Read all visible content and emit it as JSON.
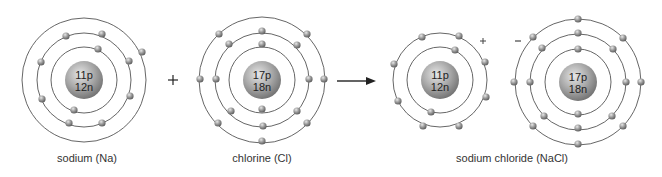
{
  "colors": {
    "orbit": "#555555",
    "electron": "#8a8a8a",
    "nucleus": "#9a9a9a",
    "text": "#222222"
  },
  "atoms": [
    {
      "id": "sodium",
      "label": "sodium (Na)",
      "protons": "11p",
      "neutrons": "12n",
      "center": [
        84,
        80
      ],
      "nucleus_r": 19,
      "shells": [
        33,
        47,
        62
      ],
      "electrons": [
        [
          98,
          49
        ],
        [
          74,
          110
        ],
        [
          66,
          36
        ],
        [
          102,
          34
        ],
        [
          41,
          62
        ],
        [
          129,
          61
        ],
        [
          42,
          99
        ],
        [
          130,
          96
        ],
        [
          69,
          123
        ],
        [
          102,
          123
        ],
        [
          142,
          52
        ]
      ]
    },
    {
      "id": "chlorine",
      "label": "chlorine (Cl)",
      "protons": "17p",
      "neutrons": "18n",
      "center": [
        262,
        80
      ],
      "nucleus_r": 19,
      "shells": [
        33,
        47,
        63
      ],
      "electrons": [
        [
          262,
          44
        ],
        [
          262,
          109
        ],
        [
          262,
          31
        ],
        [
          229,
          44
        ],
        [
          297,
          45
        ],
        [
          216,
          79
        ],
        [
          309,
          79
        ],
        [
          231,
          111
        ],
        [
          297,
          111
        ],
        [
          263,
          126
        ],
        [
          219,
          34
        ],
        [
          307,
          34
        ],
        [
          200,
          79
        ],
        [
          324,
          79
        ],
        [
          218,
          123
        ],
        [
          307,
          123
        ],
        [
          262,
          141
        ]
      ]
    },
    {
      "id": "sodium-ion",
      "label": "",
      "protons": "11p",
      "neutrons": "12n",
      "charge": "+",
      "center": [
        440,
        80
      ],
      "nucleus_r": 19,
      "shells": [
        33,
        47
      ],
      "electrons": [
        [
          455,
          50
        ],
        [
          431,
          112
        ],
        [
          422,
          37
        ],
        [
          459,
          36
        ],
        [
          394,
          64
        ],
        [
          485,
          62
        ],
        [
          398,
          101
        ],
        [
          486,
          97
        ],
        [
          423,
          126
        ],
        [
          459,
          126
        ]
      ]
    },
    {
      "id": "chloride-ion",
      "label": "",
      "protons": "17p",
      "neutrons": "18n",
      "charge": "−",
      "center": [
        578,
        82
      ],
      "nucleus_r": 19,
      "shells": [
        33,
        48,
        63
      ],
      "electrons": [
        [
          578,
          49
        ],
        [
          578,
          114
        ],
        [
          578,
          33
        ],
        [
          542,
          48
        ],
        [
          613,
          49
        ],
        [
          530,
          82
        ],
        [
          626,
          82
        ],
        [
          544,
          116
        ],
        [
          612,
          116
        ],
        [
          578,
          128
        ],
        [
          578,
          19
        ],
        [
          533,
          37
        ],
        [
          623,
          38
        ],
        [
          514,
          82
        ],
        [
          641,
          82
        ],
        [
          533,
          126
        ],
        [
          623,
          126
        ],
        [
          578,
          144
        ]
      ]
    }
  ],
  "operators": {
    "plus": "+",
    "arrow": "→",
    "ion_plus": "+",
    "ion_minus": "–"
  },
  "labels": {
    "sodium": "sodium (Na)",
    "chlorine": "chlorine (Cl)",
    "product": "sodium chloride (NaCl)"
  }
}
